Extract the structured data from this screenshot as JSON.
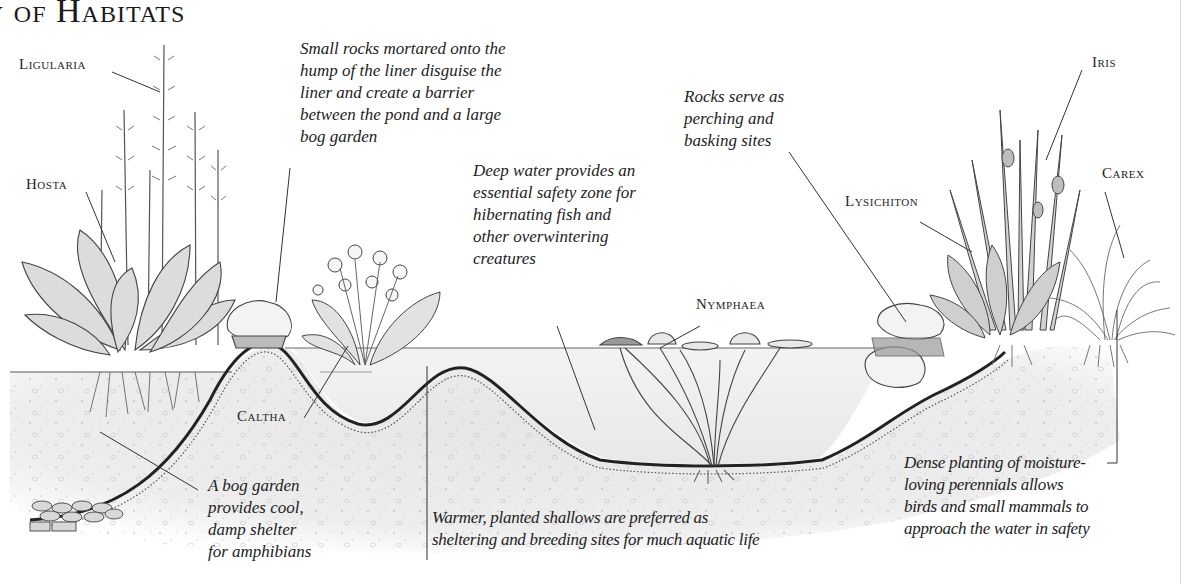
{
  "title": "y of Habitats",
  "plant_labels": {
    "ligularia": "Ligularia",
    "hosta": "Hosta",
    "caltha": "Caltha",
    "nymphaea": "Nymphaea",
    "lysichiton": "Lysichiton",
    "iris": "Iris",
    "carex": "Carex"
  },
  "annotations": {
    "rocks_liner": {
      "lines": [
        "Small rocks mortared onto the",
        "hump of the liner disguise the",
        "liner and create a barrier",
        "between the pond and a large",
        "bog garden"
      ]
    },
    "deep_water": {
      "lines": [
        "Deep water provides an",
        "essential safety zone for",
        "hibernating fish and",
        "other overwintering",
        "creatures"
      ]
    },
    "basking_rocks": {
      "lines": [
        "Rocks serve as",
        "perching and",
        "basking sites"
      ]
    },
    "bog_garden": {
      "lines": [
        "A bog garden",
        "provides cool,",
        "damp shelter",
        "for amphibians"
      ]
    },
    "shallows": {
      "lines": [
        "Warmer, planted shallows are preferred as",
        "sheltering and breeding sites for much aquatic life"
      ]
    },
    "dense_planting": {
      "lines": [
        "Dense planting of moisture-",
        "loving perennials allows",
        "birds and small mammals to",
        "approach the water in safety"
      ]
    }
  },
  "colors": {
    "ink": "#222222",
    "soil": "#e9e9e9",
    "water": "#efefef",
    "liner": "#2a2a2a",
    "foliage": "#9a9a9a",
    "rock": "#f2f2f2"
  }
}
